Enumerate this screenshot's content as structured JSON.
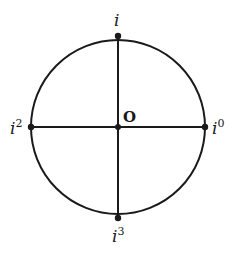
{
  "diagram": {
    "colors": {
      "stroke": "#1a1a1a",
      "background": "#ffffff"
    },
    "circle": {
      "cx": 118,
      "cy": 127,
      "r": 87
    },
    "labels": {
      "top": {
        "base": "i",
        "exp": ""
      },
      "left": {
        "base": "i",
        "exp": "2"
      },
      "right": {
        "base": "i",
        "exp": "0"
      },
      "bottom": {
        "base": "i",
        "exp": "3"
      },
      "origin": "O"
    },
    "points": [
      {
        "name": "top",
        "x": 118,
        "y": 40
      },
      {
        "name": "left",
        "x": 31,
        "y": 127
      },
      {
        "name": "right",
        "x": 205,
        "y": 127
      },
      {
        "name": "bottom",
        "x": 118,
        "y": 214
      },
      {
        "name": "origin",
        "x": 118,
        "y": 127
      }
    ]
  }
}
